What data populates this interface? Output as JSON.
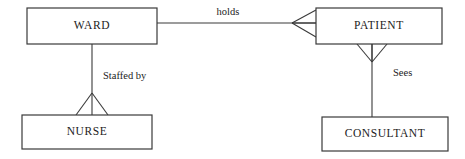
{
  "diagram": {
    "type": "entity-relationship-diagram",
    "notation": "crows-foot",
    "canvas": {
      "width": 465,
      "height": 159,
      "background": "#ffffff"
    },
    "colors": {
      "line": "#3a3a3a",
      "text": "#1b1b1b",
      "entity_fill": "#ffffff"
    },
    "entities": [
      {
        "id": "ward",
        "label": "WARD",
        "x": 27,
        "y": 8,
        "width": 130,
        "height": 36,
        "label_x": 92,
        "label_y": 26
      },
      {
        "id": "patient",
        "label": "PATIENT",
        "x": 316,
        "y": 8,
        "width": 126,
        "height": 36,
        "label_x": 379,
        "label_y": 26
      },
      {
        "id": "nurse",
        "label": "NURSE",
        "x": 22,
        "y": 115,
        "width": 130,
        "height": 34,
        "label_x": 87,
        "label_y": 132
      },
      {
        "id": "consultant",
        "label": "CONSULTANT",
        "x": 322,
        "y": 117,
        "width": 126,
        "height": 34,
        "label_x": 385,
        "label_y": 134
      }
    ],
    "relationships": [
      {
        "id": "holds",
        "label": "holds",
        "from": "ward",
        "to": "patient",
        "orientation": "horizontal",
        "line": {
          "x1": 157,
          "y1": 23,
          "x2": 316,
          "y2": 23
        },
        "label_x": 228,
        "label_y": 13,
        "label_anchor": "middle",
        "crowsfoot": {
          "at": "patient",
          "apex_x": 292,
          "apex_y": 23,
          "prong_x": 316,
          "prong_top_y": 10,
          "prong_bottom_y": 37
        }
      },
      {
        "id": "staffed-by",
        "label": "Staffed by",
        "from": "ward",
        "to": "nurse",
        "orientation": "vertical",
        "line": {
          "x1": 92,
          "y1": 44,
          "x2": 92,
          "y2": 115
        },
        "label_x": 103,
        "label_y": 77,
        "label_anchor": "start",
        "crowsfoot": {
          "at": "nurse",
          "apex_x": 92,
          "apex_y": 93,
          "prong_y": 115,
          "prong_left_x": 76,
          "prong_right_x": 108
        }
      },
      {
        "id": "sees",
        "label": "Sees",
        "from": "patient",
        "to": "consultant",
        "orientation": "vertical",
        "line": {
          "x1": 372,
          "y1": 44,
          "x2": 372,
          "y2": 117
        },
        "label_x": 393,
        "label_y": 74,
        "label_anchor": "start",
        "crowsfoot": {
          "at": "patient",
          "apex_x": 372,
          "apex_y": 62,
          "prong_y": 44,
          "prong_left_x": 357,
          "prong_right_x": 387
        }
      }
    ]
  }
}
